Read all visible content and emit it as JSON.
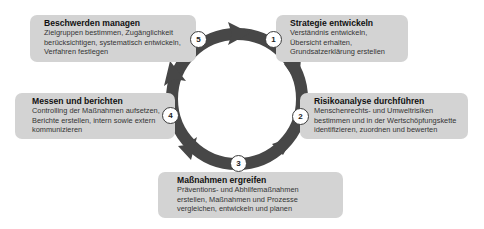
{
  "diagram": {
    "type": "cycle",
    "colors": {
      "ring": "#474747",
      "box": "#d3d3d3",
      "badge_bg": "#ffffff"
    },
    "steps": [
      {
        "number": "1",
        "title": "Strategie entwickeln",
        "lines": [
          "Verständnis entwickeln,",
          "Übersicht erhalten,",
          "Grundsatzerklärung erstellen"
        ]
      },
      {
        "number": "2",
        "title": "Risikoanalyse durchführen",
        "lines": [
          "Menschenrechts- und Umweltrisiken",
          "bestimmen und in der Wertschöpfungskette",
          "identifizieren, zuordnen und bewerten"
        ]
      },
      {
        "number": "3",
        "title": "Maßnahmen ergreifen",
        "lines": [
          "Präventions- und Abhilfemaßnahmen",
          "erstellen, Maßnahmen und Prozesse",
          "vergleichen, entwickeln und planen"
        ]
      },
      {
        "number": "4",
        "title": "Messen und berichten",
        "lines": [
          "Controlling der Maßnahmen aufsetzen,",
          "Berichte erstellen, intern sowie extern",
          "kommunizieren"
        ]
      },
      {
        "number": "5",
        "title": "Beschwerden managen",
        "lines": [
          "Zielgruppen bestimmen, Zugänglichkeit",
          "berücksichtigen, systematisch entwickeln,",
          "Verfahren festlegen"
        ]
      }
    ]
  }
}
